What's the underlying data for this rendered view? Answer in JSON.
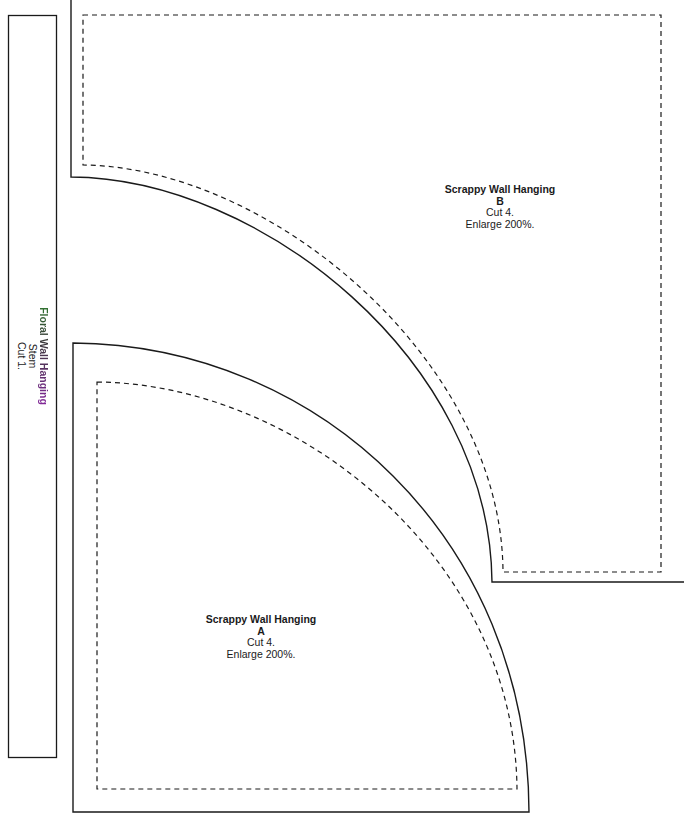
{
  "stem": {
    "title": "Floral Wall Hanging",
    "subtitle": "Stem",
    "instruction": "Cut 1."
  },
  "piece_b": {
    "title": "Scrappy Wall Hanging",
    "letter": "B",
    "cut": "Cut 4.",
    "enlarge": "Enlarge 200%."
  },
  "piece_a": {
    "title": "Scrappy Wall Hanging",
    "letter": "A",
    "cut": "Cut 4.",
    "enlarge": "Enlarge 200%."
  },
  "colors": {
    "outline": "#1a1a1a",
    "seam_dash": "#1a1a1a",
    "stem_edge_highlight_top": "#f0e040",
    "stem_edge_highlight_bottom": "#2020c0"
  }
}
